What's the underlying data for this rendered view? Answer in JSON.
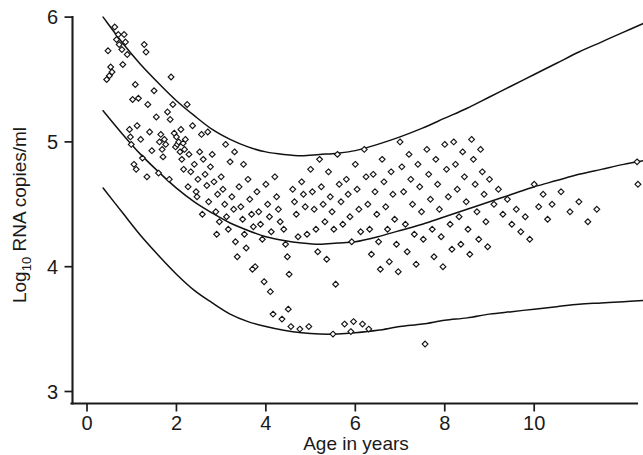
{
  "chart_data": {
    "type": "scatter",
    "title": "",
    "subtitle": "",
    "xlabel": "Age in years",
    "ylabel_main": "RNA copies/ml",
    "ylabel_prefix": "Log",
    "ylabel_subscript": "10",
    "ylabel_full": "Log10 RNA copies/ml",
    "xlim": [
      0,
      12.45
    ],
    "ylim": [
      3,
      6.07
    ],
    "xticks": [
      0,
      2,
      4,
      6,
      8,
      10
    ],
    "xtick_labels": [
      "0",
      "2",
      "4",
      "6",
      "8",
      "10"
    ],
    "yticks": [
      3,
      4,
      5,
      6
    ],
    "ytick_labels": [
      "3",
      "4",
      "5",
      "6"
    ],
    "grid": false,
    "legend": "none",
    "marker_style": "open-diamond",
    "marker_color": "#141414",
    "marker_fill": "#ffffff",
    "line_color": "#111111",
    "background_color": "#ffffff",
    "series": [
      {
        "name": "Upper reference centile",
        "type": "line",
        "x": [
          0.36,
          0.8,
          1.2,
          1.6,
          2.0,
          2.4,
          2.8,
          3.2,
          3.6,
          4.0,
          4.4,
          4.8,
          5.2,
          5.6,
          6.0,
          6.5,
          7.0,
          7.5,
          8.0,
          8.5,
          9.0,
          9.5,
          10.0,
          10.5,
          11.0,
          11.5,
          12.0,
          12.45
        ],
        "values": [
          6.0,
          5.79,
          5.62,
          5.47,
          5.33,
          5.21,
          5.1,
          5.02,
          4.96,
          4.92,
          4.9,
          4.89,
          4.9,
          4.91,
          4.93,
          4.98,
          5.04,
          5.11,
          5.19,
          5.27,
          5.36,
          5.45,
          5.54,
          5.63,
          5.72,
          5.8,
          5.88,
          5.95
        ]
      },
      {
        "name": "Median reference centile",
        "type": "line",
        "x": [
          0.36,
          0.8,
          1.2,
          1.6,
          2.0,
          2.4,
          2.8,
          3.2,
          3.6,
          4.0,
          4.4,
          4.8,
          5.2,
          5.6,
          6.0,
          6.5,
          7.0,
          7.5,
          8.0,
          8.5,
          9.0,
          9.5,
          10.0,
          10.5,
          11.0,
          11.5,
          12.0,
          12.45
        ],
        "values": [
          5.25,
          5.06,
          4.9,
          4.76,
          4.63,
          4.52,
          4.43,
          4.35,
          4.29,
          4.24,
          4.21,
          4.19,
          4.18,
          4.19,
          4.2,
          4.24,
          4.29,
          4.34,
          4.4,
          4.46,
          4.52,
          4.58,
          4.64,
          4.69,
          4.74,
          4.78,
          4.82,
          4.85
        ]
      },
      {
        "name": "Lower reference centile",
        "type": "line",
        "x": [
          0.36,
          0.8,
          1.2,
          1.6,
          2.0,
          2.4,
          2.8,
          3.2,
          3.6,
          4.0,
          4.4,
          4.8,
          5.2,
          5.6,
          6.0,
          6.5,
          7.0,
          7.5,
          8.0,
          8.5,
          9.0,
          9.5,
          10.0,
          10.5,
          11.0,
          11.5,
          12.0,
          12.45
        ],
        "values": [
          4.63,
          4.43,
          4.25,
          4.09,
          3.94,
          3.81,
          3.71,
          3.62,
          3.56,
          3.52,
          3.49,
          3.47,
          3.46,
          3.46,
          3.47,
          3.49,
          3.52,
          3.54,
          3.57,
          3.59,
          3.62,
          3.64,
          3.66,
          3.68,
          3.7,
          3.71,
          3.72,
          3.73
        ]
      },
      {
        "name": "Observations",
        "type": "scatter",
        "points": [
          [
            0.47,
            5.73
          ],
          [
            0.5,
            5.53
          ],
          [
            0.53,
            5.6
          ],
          [
            0.62,
            5.92
          ],
          [
            0.66,
            5.82
          ],
          [
            0.7,
            5.86
          ],
          [
            0.72,
            5.78
          ],
          [
            0.78,
            5.74
          ],
          [
            0.8,
            5.62
          ],
          [
            0.83,
            5.86
          ],
          [
            0.86,
            5.8
          ],
          [
            0.9,
            5.7
          ],
          [
            0.95,
            5.1
          ],
          [
            0.97,
            5.04
          ],
          [
            0.99,
            4.98
          ],
          [
            1.02,
            5.34
          ],
          [
            1.05,
            4.82
          ],
          [
            1.08,
            5.46
          ],
          [
            1.12,
            5.13
          ],
          [
            1.15,
            5.35
          ],
          [
            1.2,
            5.02
          ],
          [
            1.24,
            4.87
          ],
          [
            1.28,
            5.78
          ],
          [
            1.32,
            5.72
          ],
          [
            1.36,
            5.3
          ],
          [
            1.4,
            5.08
          ],
          [
            1.45,
            4.93
          ],
          [
            1.5,
            5.41
          ],
          [
            1.55,
            5.2
          ],
          [
            1.6,
            4.75
          ],
          [
            1.62,
            5.0
          ],
          [
            1.65,
            5.06
          ],
          [
            1.68,
            4.94
          ],
          [
            1.7,
            4.88
          ],
          [
            1.73,
            5.02
          ],
          [
            1.76,
            4.98
          ],
          [
            1.8,
            5.24
          ],
          [
            1.84,
            4.7
          ],
          [
            1.88,
            5.52
          ],
          [
            1.92,
            5.3
          ],
          [
            1.95,
            5.07
          ],
          [
            1.98,
            4.96
          ],
          [
            2.0,
            5.04
          ],
          [
            2.02,
            4.98
          ],
          [
            2.05,
            5.0
          ],
          [
            2.08,
            4.92
          ],
          [
            2.1,
            5.1
          ],
          [
            2.12,
            4.86
          ],
          [
            2.15,
            4.99
          ],
          [
            2.18,
            4.94
          ],
          [
            2.2,
            5.02
          ],
          [
            2.24,
            5.3
          ],
          [
            2.28,
            4.9
          ],
          [
            2.32,
            4.76
          ],
          [
            2.36,
            5.13
          ],
          [
            2.4,
            4.82
          ],
          [
            2.44,
            4.6
          ],
          [
            2.48,
            4.7
          ],
          [
            2.52,
            4.92
          ],
          [
            2.56,
            5.06
          ],
          [
            2.6,
            4.86
          ],
          [
            2.64,
            4.74
          ],
          [
            2.68,
            4.65
          ],
          [
            2.72,
            4.52
          ],
          [
            2.76,
            4.8
          ],
          [
            2.8,
            4.9
          ],
          [
            2.84,
            4.68
          ],
          [
            2.88,
            4.44
          ],
          [
            2.92,
            4.58
          ],
          [
            2.96,
            4.36
          ],
          [
            3.0,
            4.72
          ],
          [
            3.04,
            4.62
          ],
          [
            3.08,
            4.5
          ],
          [
            3.12,
            4.4
          ],
          [
            3.16,
            4.3
          ],
          [
            3.2,
            4.84
          ],
          [
            3.24,
            4.56
          ],
          [
            3.28,
            4.46
          ],
          [
            3.32,
            4.2
          ],
          [
            3.36,
            4.08
          ],
          [
            3.4,
            4.64
          ],
          [
            3.44,
            4.48
          ],
          [
            3.48,
            4.38
          ],
          [
            3.52,
            4.26
          ],
          [
            3.56,
            4.15
          ],
          [
            3.6,
            4.7
          ],
          [
            3.64,
            4.54
          ],
          [
            3.68,
            4.42
          ],
          [
            3.72,
            4.32
          ],
          [
            3.76,
            4.0
          ],
          [
            3.8,
            4.6
          ],
          [
            3.84,
            4.44
          ],
          [
            3.88,
            4.34
          ],
          [
            3.92,
            4.22
          ],
          [
            3.96,
            3.88
          ],
          [
            4.0,
            4.66
          ],
          [
            4.04,
            4.5
          ],
          [
            4.08,
            4.4
          ],
          [
            4.12,
            4.28
          ],
          [
            4.16,
            3.62
          ],
          [
            4.2,
            4.72
          ],
          [
            4.24,
            4.56
          ],
          [
            4.28,
            4.46
          ],
          [
            4.32,
            4.36
          ],
          [
            4.36,
            3.58
          ],
          [
            4.4,
            4.3
          ],
          [
            4.44,
            4.18
          ],
          [
            4.48,
            4.08
          ],
          [
            4.52,
            3.94
          ],
          [
            4.56,
            3.52
          ],
          [
            4.6,
            4.62
          ],
          [
            4.64,
            4.52
          ],
          [
            4.68,
            4.42
          ],
          [
            4.72,
            4.24
          ],
          [
            4.76,
            3.5
          ],
          [
            4.8,
            4.68
          ],
          [
            4.84,
            4.58
          ],
          [
            4.88,
            4.48
          ],
          [
            4.92,
            4.26
          ],
          [
            4.96,
            3.52
          ],
          [
            5.0,
            4.78
          ],
          [
            5.04,
            4.6
          ],
          [
            5.08,
            4.46
          ],
          [
            5.12,
            4.3
          ],
          [
            5.16,
            4.12
          ],
          [
            5.2,
            4.86
          ],
          [
            5.24,
            4.64
          ],
          [
            5.28,
            4.5
          ],
          [
            5.32,
            4.36
          ],
          [
            5.36,
            4.06
          ],
          [
            5.4,
            4.76
          ],
          [
            5.44,
            4.56
          ],
          [
            5.48,
            4.44
          ],
          [
            5.52,
            4.3
          ],
          [
            5.56,
            3.86
          ],
          [
            5.6,
            4.9
          ],
          [
            5.64,
            4.66
          ],
          [
            5.68,
            4.52
          ],
          [
            5.72,
            4.34
          ],
          [
            5.76,
            3.54
          ],
          [
            5.8,
            4.7
          ],
          [
            5.84,
            4.58
          ],
          [
            5.88,
            4.4
          ],
          [
            5.92,
            4.2
          ],
          [
            5.96,
            3.56
          ],
          [
            6.0,
            4.82
          ],
          [
            6.04,
            4.62
          ],
          [
            6.08,
            4.46
          ],
          [
            6.12,
            4.28
          ],
          [
            6.16,
            3.54
          ],
          [
            6.2,
            4.94
          ],
          [
            6.24,
            4.72
          ],
          [
            6.28,
            4.5
          ],
          [
            6.32,
            4.3
          ],
          [
            6.36,
            4.1
          ],
          [
            6.4,
            4.74
          ],
          [
            6.44,
            4.6
          ],
          [
            6.48,
            4.42
          ],
          [
            6.52,
            4.2
          ],
          [
            6.56,
            3.98
          ],
          [
            6.6,
            4.86
          ],
          [
            6.64,
            4.68
          ],
          [
            6.68,
            4.48
          ],
          [
            6.72,
            4.3
          ],
          [
            6.76,
            4.04
          ],
          [
            6.8,
            4.76
          ],
          [
            6.84,
            4.58
          ],
          [
            6.88,
            4.38
          ],
          [
            6.92,
            4.18
          ],
          [
            6.96,
            3.96
          ],
          [
            7.0,
            5.0
          ],
          [
            7.04,
            4.8
          ],
          [
            7.08,
            4.6
          ],
          [
            7.12,
            4.34
          ],
          [
            7.16,
            4.12
          ],
          [
            7.2,
            4.9
          ],
          [
            7.24,
            4.7
          ],
          [
            7.28,
            4.5
          ],
          [
            7.32,
            4.26
          ],
          [
            7.36,
            4.02
          ],
          [
            7.4,
            4.82
          ],
          [
            7.44,
            4.64
          ],
          [
            7.48,
            4.44
          ],
          [
            7.52,
            4.22
          ],
          [
            7.56,
            3.38
          ],
          [
            7.6,
            4.94
          ],
          [
            7.64,
            4.74
          ],
          [
            7.68,
            4.54
          ],
          [
            7.72,
            4.3
          ],
          [
            7.76,
            4.08
          ],
          [
            7.8,
            4.86
          ],
          [
            7.84,
            4.66
          ],
          [
            7.88,
            4.46
          ],
          [
            7.92,
            4.24
          ],
          [
            7.96,
            4.0
          ],
          [
            8.0,
            4.98
          ],
          [
            8.04,
            4.78
          ],
          [
            8.08,
            4.56
          ],
          [
            8.12,
            4.34
          ],
          [
            8.16,
            4.14
          ],
          [
            8.2,
            5.0
          ],
          [
            8.24,
            4.82
          ],
          [
            8.28,
            4.62
          ],
          [
            8.32,
            4.4
          ],
          [
            8.36,
            4.18
          ],
          [
            8.4,
            4.92
          ],
          [
            8.44,
            4.72
          ],
          [
            8.48,
            4.52
          ],
          [
            8.52,
            4.3
          ],
          [
            8.56,
            4.1
          ],
          [
            8.6,
            5.02
          ],
          [
            8.64,
            4.86
          ],
          [
            8.68,
            4.66
          ],
          [
            8.72,
            4.44
          ],
          [
            8.76,
            4.22
          ],
          [
            8.8,
            4.94
          ],
          [
            8.84,
            4.76
          ],
          [
            8.88,
            4.58
          ],
          [
            8.92,
            4.36
          ],
          [
            8.96,
            4.16
          ],
          [
            9.0,
            4.7
          ],
          [
            9.1,
            4.5
          ],
          [
            9.2,
            4.62
          ],
          [
            9.3,
            4.42
          ],
          [
            9.4,
            4.54
          ],
          [
            9.5,
            4.34
          ],
          [
            9.6,
            4.46
          ],
          [
            9.7,
            4.28
          ],
          [
            9.8,
            4.4
          ],
          [
            9.9,
            4.22
          ],
          [
            10.0,
            4.66
          ],
          [
            10.1,
            4.48
          ],
          [
            10.2,
            4.58
          ],
          [
            10.3,
            4.38
          ],
          [
            10.4,
            4.5
          ],
          [
            10.6,
            4.6
          ],
          [
            10.8,
            4.44
          ],
          [
            11.0,
            4.52
          ],
          [
            11.2,
            4.36
          ],
          [
            11.4,
            4.46
          ],
          [
            12.3,
            4.84
          ],
          [
            12.32,
            4.66
          ],
          [
            12.34,
            4.56
          ],
          [
            12.36,
            4.4
          ],
          [
            0.44,
            5.5
          ],
          [
            0.56,
            5.56
          ],
          [
            1.1,
            4.78
          ],
          [
            1.34,
            4.72
          ],
          [
            2.26,
            4.64
          ],
          [
            2.9,
            4.26
          ],
          [
            3.3,
            4.92
          ],
          [
            3.7,
            3.98
          ],
          [
            4.1,
            3.8
          ],
          [
            4.5,
            3.66
          ],
          [
            5.5,
            3.46
          ],
          [
            5.9,
            3.48
          ],
          [
            6.3,
            3.5
          ],
          [
            2.7,
            5.08
          ],
          [
            3.1,
            4.98
          ],
          [
            1.86,
            5.18
          ],
          [
            2.16,
            4.78
          ],
          [
            2.46,
            4.56
          ],
          [
            2.58,
            4.42
          ],
          [
            3.5,
            4.82
          ]
        ]
      }
    ]
  },
  "axis": {
    "x_title": "Age in years",
    "y_title_prefix": "Log",
    "y_title_subscript": "10",
    "y_title_main": "RNA copies/ml"
  }
}
